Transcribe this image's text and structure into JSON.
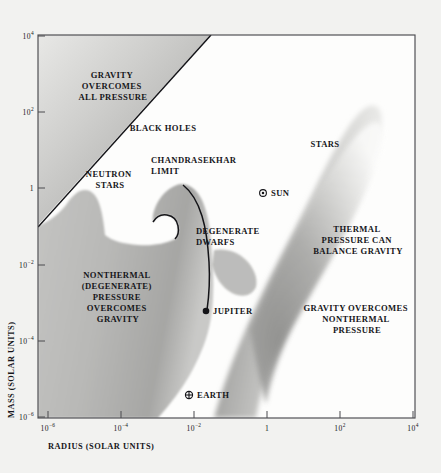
{
  "figure": {
    "name": "mass-radius-diagram",
    "background_color": "#f2f2f0",
    "plot_background_color": "#fdfdfc",
    "frame_color": "#4a4a4e",
    "shade_color": "#9a9a9a",
    "line_color": "#141418"
  },
  "axes": {
    "x": {
      "title": "RADIUS (SOLAR UNITS)",
      "ticks": [
        {
          "label_mantissa": "10",
          "label_exponent": "−6",
          "value": -6
        },
        {
          "label_mantissa": "10",
          "label_exponent": "−4",
          "value": -4
        },
        {
          "label_mantissa": "10",
          "label_exponent": "−2",
          "value": -2
        },
        {
          "label_mantissa": "1",
          "label_exponent": "",
          "value": 0
        },
        {
          "label_mantissa": "10",
          "label_exponent": "2",
          "value": 2
        },
        {
          "label_mantissa": "10",
          "label_exponent": "4",
          "value": 4
        }
      ],
      "min": -7,
      "max": 5
    },
    "y": {
      "title": "MASS (SOLAR UNITS)",
      "ticks": [
        {
          "label_mantissa": "10",
          "label_exponent": "4",
          "value": 4
        },
        {
          "label_mantissa": "10",
          "label_exponent": "2",
          "value": 2
        },
        {
          "label_mantissa": "1",
          "label_exponent": "",
          "value": 0
        },
        {
          "label_mantissa": "10",
          "label_exponent": "−2",
          "value": -2
        },
        {
          "label_mantissa": "10",
          "label_exponent": "−4",
          "value": -4
        },
        {
          "label_mantissa": "10",
          "label_exponent": "−6",
          "value": -6
        }
      ],
      "min": -6,
      "max": 4
    }
  },
  "regions": [
    {
      "id": "gravity-overcomes-all-pressure",
      "lines": [
        "GRAVITY",
        "OVERCOMES",
        "ALL PRESSURE"
      ],
      "x": 113,
      "y": 78
    },
    {
      "id": "black-holes",
      "lines": [
        "BLACK HOLES"
      ],
      "x": 163,
      "y": 131
    },
    {
      "id": "neutron-stars",
      "lines": [
        "NEUTRON",
        "STARS"
      ],
      "x": 110,
      "y": 177
    },
    {
      "id": "chandrasekhar-limit",
      "lines": [
        "CHANDRASEKHAR",
        "LIMIT"
      ],
      "x": 197,
      "y": 163
    },
    {
      "id": "stars",
      "lines": [
        "STARS"
      ],
      "x": 325,
      "y": 147
    },
    {
      "id": "thermal-pressure-can-balance-gravity",
      "lines": [
        "THERMAL",
        "PRESSURE CAN",
        "BALANCE GRAVITY"
      ],
      "x": 358,
      "y": 232
    },
    {
      "id": "degenerate-dwarfs",
      "lines": [
        "DEGENERATE",
        "DWARFS"
      ],
      "x": 241,
      "y": 234
    },
    {
      "id": "nonthermal-degenerate-pressure-overcomes-gravity",
      "lines": [
        "NONTHERMAL",
        "(DEGENERATE)",
        "PRESSURE",
        "OVERCOMES",
        "GRAVITY"
      ],
      "x": 118,
      "y": 278
    },
    {
      "id": "gravity-overcomes-nonthermal-pressure",
      "lines": [
        "GRAVITY OVERCOMES",
        "NONTHERMAL",
        "PRESSURE"
      ],
      "x": 357,
      "y": 311
    }
  ],
  "points": [
    {
      "id": "sun",
      "label": "SUN",
      "marker": "sun-symbol",
      "marker_x": 263,
      "marker_y": 193,
      "label_x": 271,
      "label_y": 196
    },
    {
      "id": "jupiter",
      "label": "JUPITER",
      "marker": "filled-dot",
      "marker_x": 206,
      "marker_y": 311,
      "label_x": 213,
      "label_y": 314
    },
    {
      "id": "earth",
      "label": "EARTH",
      "marker": "earth-symbol",
      "marker_x": 189,
      "marker_y": 395,
      "label_x": 197,
      "label_y": 398
    }
  ]
}
